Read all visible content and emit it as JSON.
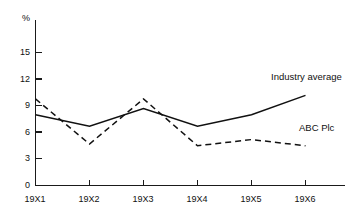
{
  "chart_data": {
    "type": "line",
    "title": "",
    "subtitle": "",
    "xlabel": "",
    "ylabel": "%",
    "unit_label": "%",
    "categories": [
      "19X1",
      "19X2",
      "19X3",
      "19X4",
      "19X5",
      "19X6"
    ],
    "ylim": [
      0,
      16.5
    ],
    "yticks": [
      0,
      3,
      6,
      9,
      12,
      15
    ],
    "ytick_labels": [
      "0",
      "3",
      "6",
      "9",
      "12",
      "15"
    ],
    "grid": false,
    "legend_position": "inline-annotation",
    "series": [
      {
        "name": "Industry average",
        "style": "solid",
        "color": "#111111",
        "values": [
          8.0,
          6.7,
          8.7,
          6.7,
          8.0,
          10.2
        ]
      },
      {
        "name": "ABC Plc",
        "style": "dashed",
        "color": "#111111",
        "values": [
          9.8,
          4.7,
          9.8,
          4.5,
          5.2,
          4.5
        ]
      }
    ],
    "annotations": [
      {
        "text": "Industry average",
        "x": 271,
        "y": 71
      },
      {
        "text": "ABC Plc",
        "x": 299,
        "y": 122
      }
    ]
  }
}
